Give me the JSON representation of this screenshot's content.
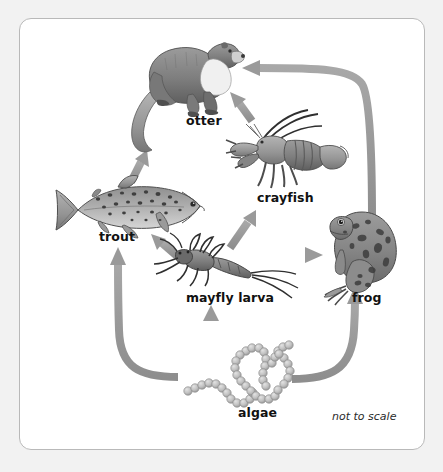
{
  "diagram": {
    "scale_note": "not to scale",
    "background_color": "#f2f2f2",
    "panel_color": "#ffffff",
    "panel_border_color": "#b9b9b9",
    "arrow_color": "#9a9a9a"
  },
  "nodes": [
    {
      "id": "otter",
      "label": "otter",
      "icon": "otter-icon",
      "label_x": 186,
      "label_y": 113,
      "art_x": 118,
      "art_y": 38,
      "color": "#8b8b8b",
      "trophic_level": "top predator"
    },
    {
      "id": "crayfish",
      "label": "crayfish",
      "icon": "crayfish-icon",
      "label_x": 257,
      "label_y": 190,
      "art_x": 228,
      "art_y": 118,
      "color": "#7d7d7d",
      "trophic_level": "consumer"
    },
    {
      "id": "trout",
      "label": "trout",
      "icon": "trout-icon",
      "label_x": 99,
      "label_y": 229,
      "art_x": 48,
      "art_y": 178,
      "color": "#9d9d9d",
      "trophic_level": "consumer"
    },
    {
      "id": "mayfly-larva",
      "label": "mayfly larva",
      "icon": "mayfly-larva-icon",
      "label_x": 186,
      "label_y": 290,
      "art_x": 148,
      "art_y": 238,
      "color": "#6f6f6f",
      "trophic_level": "consumer"
    },
    {
      "id": "frog",
      "label": "frog",
      "icon": "frog-icon",
      "label_x": 352,
      "label_y": 290,
      "art_x": 318,
      "art_y": 212,
      "color": "#8a8a8a",
      "trophic_level": "consumer"
    },
    {
      "id": "algae",
      "label": "algae",
      "icon": "algae-icon",
      "label_x": 238,
      "label_y": 405,
      "art_x": 176,
      "art_y": 338,
      "color": "#c0c0c0",
      "trophic_level": "producer"
    }
  ],
  "arrows": [
    {
      "id": "algae-to-mayfly",
      "from": "algae",
      "to": "mayfly-larva",
      "shape": "straight-up"
    },
    {
      "id": "algae-to-trout",
      "from": "algae",
      "to": "trout",
      "shape": "curve-left-up"
    },
    {
      "id": "algae-to-frog",
      "from": "algae",
      "to": "frog",
      "shape": "curve-right-up"
    },
    {
      "id": "mayfly-to-trout",
      "from": "mayfly-larva",
      "to": "trout",
      "shape": "diagonal-up-left"
    },
    {
      "id": "mayfly-to-crayfish",
      "from": "mayfly-larva",
      "to": "crayfish",
      "shape": "diagonal-up-right"
    },
    {
      "id": "mayfly-to-frog",
      "from": "mayfly-larva",
      "to": "frog",
      "shape": "straight-right"
    },
    {
      "id": "trout-to-otter",
      "from": "trout",
      "to": "otter",
      "shape": "diagonal-up-right"
    },
    {
      "id": "crayfish-to-otter",
      "from": "crayfish",
      "to": "otter",
      "shape": "diagonal-up-left"
    },
    {
      "id": "frog-to-otter",
      "from": "frog",
      "to": "otter",
      "shape": "curve-up-then-left"
    }
  ]
}
